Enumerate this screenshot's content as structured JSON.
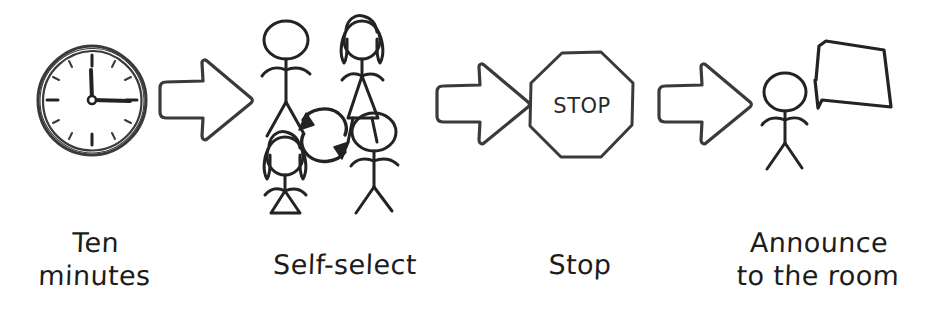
{
  "diagram": {
    "background_color": "#ffffff",
    "ink_color": "#3a3a3c",
    "text_color": "#1c1c1c",
    "orientation": "left-to-right",
    "steps": [
      {
        "id": "step-1",
        "icon": "clock-icon",
        "label": "Ten\nminutes",
        "label_line_1": "Ten",
        "label_line_2": "minutes",
        "clock": {
          "hour_hand": "12",
          "minute_hand": "3",
          "reads": "3:00"
        }
      },
      {
        "id": "step-2",
        "icon": "people-self-select-icon",
        "label": "Self-select",
        "label_line_1": "Self-select",
        "label_line_2": "",
        "figures": [
          {
            "position": "top-left",
            "gender": "male"
          },
          {
            "position": "top-right",
            "gender": "female"
          },
          {
            "position": "bottom-left",
            "gender": "female"
          },
          {
            "position": "bottom-right",
            "gender": "male"
          }
        ],
        "center_icon": "cycle-arrows-icon"
      },
      {
        "id": "step-3",
        "icon": "stop-sign-icon",
        "label": "Stop",
        "label_line_1": "Stop",
        "label_line_2": "",
        "sign_text": "STOP"
      },
      {
        "id": "step-4",
        "icon": "person-speech-bubble-icon",
        "label": "Announce\nto the room",
        "label_line_1": "Announce",
        "label_line_2": "to the room",
        "speech_bubble_text": ""
      }
    ],
    "connectors": [
      {
        "id": "arrow-1",
        "icon": "block-arrow-right-icon",
        "from": "step-1",
        "to": "step-2"
      },
      {
        "id": "arrow-2",
        "icon": "block-arrow-right-icon",
        "from": "step-2",
        "to": "step-3"
      },
      {
        "id": "arrow-3",
        "icon": "block-arrow-right-icon",
        "from": "step-3",
        "to": "step-4"
      }
    ]
  }
}
